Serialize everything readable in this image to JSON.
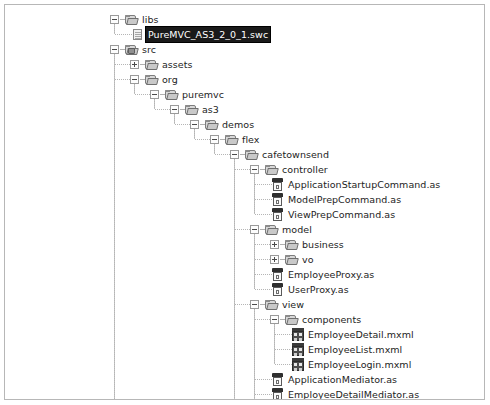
{
  "panel": {
    "name": "flex-builder-package-explorer",
    "background": "#ffffff",
    "border_color": "#b7b7b7",
    "selection_bg": "#1a1a1a",
    "selection_fg": "#ffffff"
  },
  "tree": {
    "nodes": [
      {
        "id": "libs",
        "label": "libs",
        "depth": 0,
        "type": "folder",
        "state": "expanded",
        "selected": false
      },
      {
        "id": "puremvc-swc",
        "label": "PureMVC_AS3_2_0_1.swc",
        "depth": 1,
        "type": "file",
        "state": "leaf",
        "selected": true
      },
      {
        "id": "src",
        "label": "src",
        "depth": 0,
        "type": "srcfolder",
        "state": "expanded",
        "selected": false
      },
      {
        "id": "assets",
        "label": "assets",
        "depth": 1,
        "type": "folder",
        "state": "collapsed",
        "selected": false
      },
      {
        "id": "org",
        "label": "org",
        "depth": 1,
        "type": "folder",
        "state": "expanded",
        "selected": false
      },
      {
        "id": "puremvc",
        "label": "puremvc",
        "depth": 2,
        "type": "folder",
        "state": "expanded",
        "selected": false
      },
      {
        "id": "as3",
        "label": "as3",
        "depth": 3,
        "type": "folder",
        "state": "expanded",
        "selected": false
      },
      {
        "id": "demos",
        "label": "demos",
        "depth": 4,
        "type": "folder",
        "state": "expanded",
        "selected": false
      },
      {
        "id": "flex",
        "label": "flex",
        "depth": 5,
        "type": "folder",
        "state": "expanded",
        "selected": false
      },
      {
        "id": "cafetownsend",
        "label": "cafetownsend",
        "depth": 6,
        "type": "folder",
        "state": "expanded",
        "selected": false
      },
      {
        "id": "controller",
        "label": "controller",
        "depth": 7,
        "type": "folder",
        "state": "expanded",
        "selected": false
      },
      {
        "id": "ApplicationStartupCommand",
        "label": "ApplicationStartupCommand.as",
        "depth": 8,
        "type": "as",
        "state": "leaf",
        "selected": false
      },
      {
        "id": "ModelPrepCommand",
        "label": "ModelPrepCommand.as",
        "depth": 8,
        "type": "as",
        "state": "leaf",
        "selected": false
      },
      {
        "id": "ViewPrepCommand",
        "label": "ViewPrepCommand.as",
        "depth": 8,
        "type": "as",
        "state": "leaf",
        "selected": false
      },
      {
        "id": "model",
        "label": "model",
        "depth": 7,
        "type": "folder",
        "state": "expanded",
        "selected": false
      },
      {
        "id": "business",
        "label": "business",
        "depth": 8,
        "type": "folder",
        "state": "collapsed",
        "selected": false
      },
      {
        "id": "vo",
        "label": "vo",
        "depth": 8,
        "type": "folder",
        "state": "collapsed",
        "selected": false
      },
      {
        "id": "EmployeeProxy",
        "label": "EmployeeProxy.as",
        "depth": 8,
        "type": "as",
        "state": "leaf",
        "selected": false
      },
      {
        "id": "UserProxy",
        "label": "UserProxy.as",
        "depth": 8,
        "type": "as",
        "state": "leaf",
        "selected": false
      },
      {
        "id": "view",
        "label": "view",
        "depth": 7,
        "type": "folder",
        "state": "expanded",
        "selected": false
      },
      {
        "id": "components",
        "label": "components",
        "depth": 8,
        "type": "folder",
        "state": "expanded",
        "selected": false
      },
      {
        "id": "EmployeeDetail",
        "label": "EmployeeDetail.mxml",
        "depth": 9,
        "type": "mxml",
        "state": "leaf",
        "selected": false
      },
      {
        "id": "EmployeeList",
        "label": "EmployeeList.mxml",
        "depth": 9,
        "type": "mxml",
        "state": "leaf",
        "selected": false
      },
      {
        "id": "EmployeeLogin",
        "label": "EmployeeLogin.mxml",
        "depth": 9,
        "type": "mxml",
        "state": "leaf",
        "selected": false
      },
      {
        "id": "ApplicationMediator",
        "label": "ApplicationMediator.as",
        "depth": 8,
        "type": "as",
        "state": "leaf",
        "selected": false
      },
      {
        "id": "EmployeeDetailMediator",
        "label": "EmployeeDetailMediator.as",
        "depth": 8,
        "type": "as",
        "state": "leaf",
        "selected": false
      },
      {
        "id": "EmployeeListMediator",
        "label": "EmployeeListMediator.as",
        "depth": 8,
        "type": "as",
        "state": "leaf",
        "selected": false
      },
      {
        "id": "EmployeeLoginMediator",
        "label": "EmployeeLoginMediator.as",
        "depth": 8,
        "type": "as",
        "state": "leaf",
        "selected": false
      },
      {
        "id": "ApplicationFacade",
        "label": "ApplicationFacade.as",
        "depth": 7,
        "type": "as",
        "state": "leaf",
        "selected": false
      },
      {
        "id": "CafeTownsend",
        "label": "CafeTownsend.mxml",
        "depth": 1,
        "type": "mxml",
        "state": "leaf",
        "selected": false
      }
    ]
  },
  "layout": {
    "row_height": 15,
    "first_row_top": 7,
    "indent": 20,
    "base_left": 109
  }
}
